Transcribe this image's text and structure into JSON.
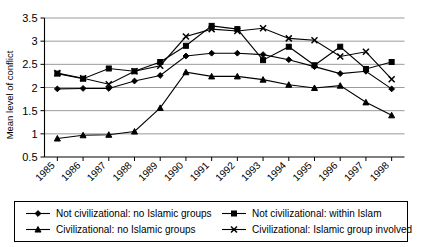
{
  "chart_data": {
    "type": "line",
    "title": "",
    "xlabel": "",
    "ylabel": "Mean level of conflict",
    "ylim": [
      0.5,
      3.5
    ],
    "ytick_labels": [
      "0.5",
      "1",
      "1.5",
      "2",
      "2.5",
      "3",
      "3.5"
    ],
    "ytick_values": [
      0.5,
      1,
      1.5,
      2,
      2.5,
      3,
      3.5
    ],
    "grid": true,
    "legend_position": "bottom",
    "categories": [
      "1985",
      "1986",
      "1987",
      "1988",
      "1989",
      "1990",
      "1991",
      "1992",
      "1993",
      "1994",
      "1995",
      "1996",
      "1997",
      "1998"
    ],
    "x": [
      1985,
      1986,
      1987,
      1988,
      1989,
      1990,
      1991,
      1992,
      1993,
      1994,
      1995,
      1996,
      1997,
      1998
    ],
    "series": [
      {
        "name": "Not civilizational: no Islamic groups",
        "marker": "diamond",
        "values": [
          1.97,
          1.98,
          1.98,
          2.14,
          2.26,
          2.68,
          2.74,
          2.74,
          2.71,
          2.6,
          2.45,
          2.3,
          2.35,
          1.97
        ]
      },
      {
        "name": "Not civilizational: within Islam",
        "marker": "square",
        "values": [
          2.3,
          2.19,
          2.41,
          2.35,
          2.55,
          2.9,
          3.33,
          3.26,
          2.59,
          2.88,
          2.48,
          2.88,
          2.4,
          2.55
        ]
      },
      {
        "name": "Civilizational: no Islamic groups",
        "marker": "triangle",
        "values": [
          0.9,
          0.97,
          0.98,
          1.05,
          1.56,
          2.33,
          2.24,
          2.24,
          2.17,
          2.06,
          1.99,
          2.04,
          1.68,
          1.4
        ]
      },
      {
        "name": "Civilizational: Islamic group involved",
        "marker": "cross",
        "values": [
          2.31,
          2.2,
          2.07,
          2.35,
          2.47,
          3.1,
          3.26,
          3.22,
          3.28,
          3.06,
          3.02,
          2.67,
          2.77,
          2.18
        ]
      }
    ]
  },
  "legend": {
    "entries": [
      {
        "label": "Not civilizational: no Islamic groups",
        "marker": "diamond"
      },
      {
        "label": "Not civilizational: within Islam",
        "marker": "square"
      },
      {
        "label": "Civilizational: no Islamic groups",
        "marker": "triangle"
      },
      {
        "label": "Civilizational: Islamic group involved",
        "marker": "cross"
      }
    ]
  },
  "colors": {
    "series": "#000000",
    "grid": "#808080",
    "axis": "#000000",
    "background": "#ffffff"
  }
}
